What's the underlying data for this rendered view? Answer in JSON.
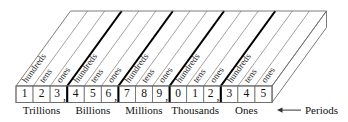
{
  "figure": {
    "digits": [
      {
        "value": "1",
        "separator": ""
      },
      {
        "value": "2",
        "separator": ""
      },
      {
        "value": "3",
        "separator": ","
      },
      {
        "value": "4",
        "separator": ""
      },
      {
        "value": "5",
        "separator": ""
      },
      {
        "value": "6",
        "separator": ","
      },
      {
        "value": "7",
        "separator": ""
      },
      {
        "value": "8",
        "separator": ""
      },
      {
        "value": "9",
        "separator": ","
      },
      {
        "value": "0",
        "separator": ""
      },
      {
        "value": "1",
        "separator": ""
      },
      {
        "value": "2",
        "separator": ","
      },
      {
        "value": "3",
        "separator": ""
      },
      {
        "value": "4",
        "separator": ""
      },
      {
        "value": "5",
        "separator": ""
      }
    ],
    "place_labels": [
      "hundreds",
      "tens",
      "ones",
      "hundreds",
      "tens",
      "ones",
      "hundreds",
      "tens",
      "ones",
      "hundreds",
      "tens",
      "ones",
      "hundreds",
      "tens",
      "ones"
    ],
    "period_labels": [
      "Trillions",
      "Billions",
      "Millions",
      "Thousands",
      "Ones"
    ],
    "callout": {
      "label": "Periods",
      "arrow": "left-arrow-icon"
    },
    "colors": {
      "period_divider": "#000000",
      "place_divider": "#8a8a8a",
      "box_edge": "#6e6e6e",
      "text": "#111111",
      "background": "#ffffff"
    },
    "number_read": "123,456,789,012,345"
  }
}
